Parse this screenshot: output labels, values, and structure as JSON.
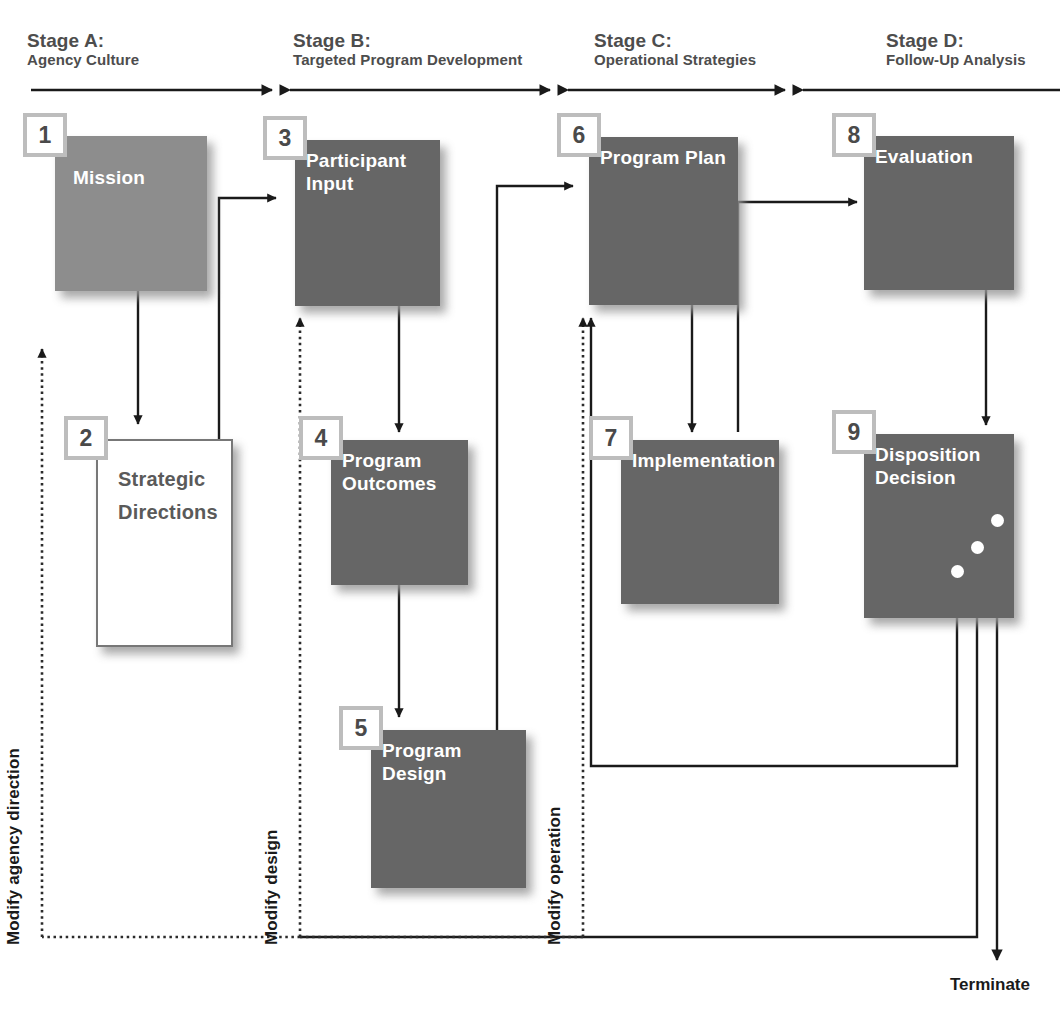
{
  "diagram": {
    "colors": {
      "box_dark": "#666666",
      "box_light": "#8d8d8d",
      "box_white": "#ffffff",
      "tag_border": "#bdbdbd",
      "header_text": "#4d4d4d",
      "line": "#1a1a1a"
    },
    "stages": [
      {
        "title": "Stage A:",
        "subtitle": "Agency Culture"
      },
      {
        "title": "Stage B:",
        "subtitle": "Targeted Program Development"
      },
      {
        "title": "Stage C:",
        "subtitle": "Operational Strategies"
      },
      {
        "title": "Stage D:",
        "subtitle": "Follow-Up Analysis"
      }
    ],
    "nodes": [
      {
        "number": "1",
        "label": "Mission",
        "style": "light"
      },
      {
        "number": "2",
        "label": "Strategic\nDirections",
        "style": "white"
      },
      {
        "number": "3",
        "label": "Participant\nInput",
        "style": "dark"
      },
      {
        "number": "4",
        "label": "Program\nOutcomes",
        "style": "dark"
      },
      {
        "number": "5",
        "label": "Program Design",
        "style": "dark"
      },
      {
        "number": "6",
        "label": "Program Plan",
        "style": "dark"
      },
      {
        "number": "7",
        "label": "Implementation",
        "style": "dark"
      },
      {
        "number": "8",
        "label": "Evaluation",
        "style": "dark"
      },
      {
        "number": "9",
        "label": "Disposition\nDecision",
        "style": "dark"
      }
    ],
    "feedback_labels": [
      {
        "text": "Modify agency direction"
      },
      {
        "text": "Modify design"
      },
      {
        "text": "Modify operation"
      }
    ],
    "terminal": {
      "label": "Terminate"
    }
  }
}
